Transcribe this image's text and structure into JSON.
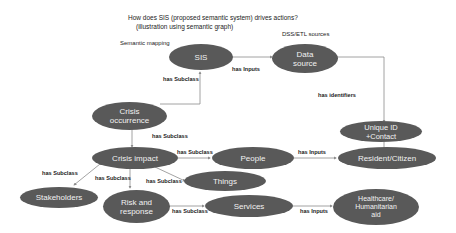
{
  "title": {
    "line1": "How does SIS  (proposed semantic system) drives actions?",
    "line2": "(illustration using semantic graph)"
  },
  "notes": {
    "semantic_mapping": "Semantic mapping",
    "dss_etl": "DSS/ETL sources"
  },
  "nodes": {
    "sis": "SIS",
    "data_source": "Data\nsource",
    "unique_id": "Unique ID\n+Contact",
    "crisis_occurrence": "Crisis\noccurrence",
    "crisis_impact": "Crisis impact",
    "people": "People",
    "things": "Things",
    "resident": "Resident/Citizen",
    "stakeholders": "Stakeholders",
    "risk_response": "Risk and\nresponse",
    "services": "Services",
    "healthcare": "Healthcare/\nHumanitarian\naid"
  },
  "edges": {
    "sis_to_data": "has Inputs",
    "occurrence_to_sis": "has Subclass",
    "data_to_unique": "has identifiers",
    "occurrence_to_impact": "has Subclass",
    "impact_to_people": "has Subclass",
    "people_to_resident": "has Inputs",
    "impact_to_stakeholders": "has Subclass",
    "impact_to_risk": "has Subclass",
    "impact_to_things": "has Subclass",
    "risk_to_services": "has Subclass",
    "services_to_healthcare": "has Inputs"
  },
  "colors": {
    "node_fill": "#595959",
    "node_text": "#f2f2f2",
    "edge": "#8c8c8c"
  }
}
